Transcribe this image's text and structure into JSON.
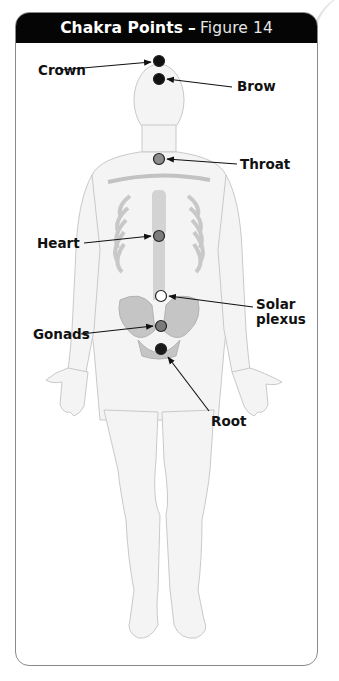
{
  "figure": {
    "title_bold": "Chakra Points",
    "title_dash": "–",
    "title_light": "Figure 14"
  },
  "chakras": [
    {
      "name": "Crown",
      "label": "Crown",
      "color": "#111111"
    },
    {
      "name": "Brow",
      "label": "Brow",
      "color": "#111111"
    },
    {
      "name": "Throat",
      "label": "Throat",
      "color": "#8c8c8c"
    },
    {
      "name": "Heart",
      "label": "Heart",
      "color": "#7c7c7c"
    },
    {
      "name": "Solar plexus",
      "label_line1": "Solar",
      "label_line2": "plexus",
      "color": "#ffffff"
    },
    {
      "name": "Gonads",
      "label": "Gonads",
      "color": "#7a7a7a"
    },
    {
      "name": "Root",
      "label": "Root",
      "color": "#1a1a1a"
    }
  ],
  "colors": {
    "header_bg": "#050505",
    "header_text": "#ffffff",
    "border": "#8a8a8a",
    "skin": "#f3f3f3",
    "skeleton": "#b5b5b5"
  }
}
